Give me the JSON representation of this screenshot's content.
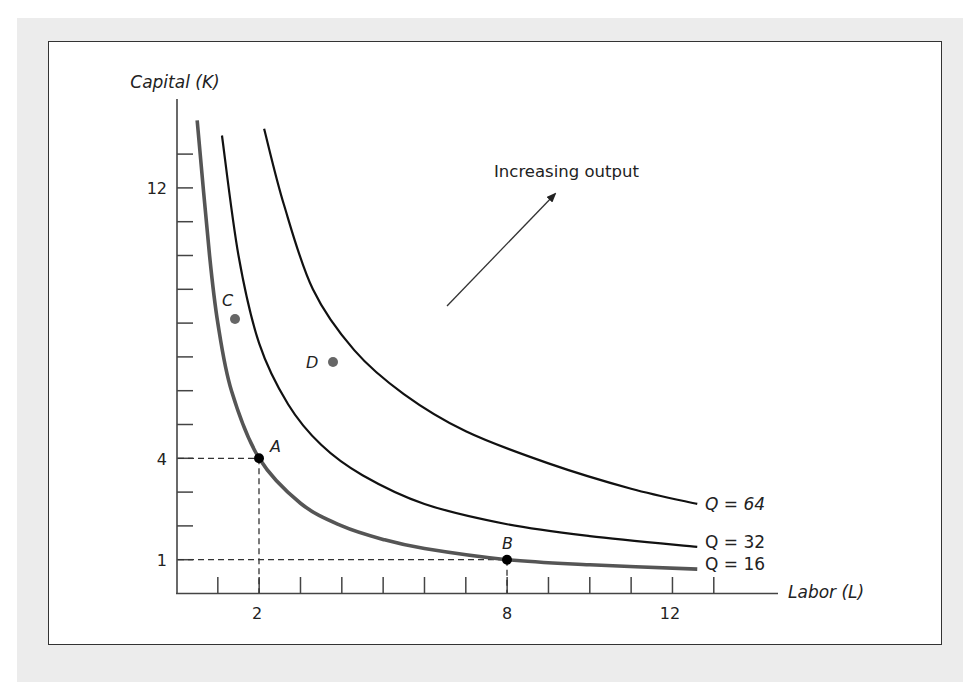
{
  "chart_data": {
    "type": "line",
    "title": "",
    "xlabel": "Labor (L)",
    "ylabel": "Capital (K)",
    "xlim": [
      0,
      14.7
    ],
    "ylim": [
      0,
      14.6
    ],
    "grid": false,
    "x_ticks": [
      1,
      2,
      3,
      4,
      5,
      6,
      7,
      8,
      9,
      10,
      11,
      12,
      13
    ],
    "x_tick_labels": [
      {
        "value": 2,
        "label": "2"
      },
      {
        "value": 8,
        "label": "8"
      },
      {
        "value": 12,
        "label": "12"
      }
    ],
    "y_ticks": [
      1,
      2,
      3,
      4,
      5,
      6,
      7,
      8,
      9,
      10,
      11,
      12,
      13
    ],
    "y_tick_labels": [
      {
        "value": 1,
        "label": "1"
      },
      {
        "value": 4,
        "label": "4"
      },
      {
        "value": 12,
        "label": "12"
      }
    ],
    "series": [
      {
        "name": "Q = 16",
        "color": "#555555",
        "width": 3.5,
        "points": [
          [
            0.5,
            14.0
          ],
          [
            0.8,
            10.0
          ],
          [
            1.0,
            8.0
          ],
          [
            1.33,
            6.0
          ],
          [
            2,
            4
          ],
          [
            3,
            2.67
          ],
          [
            4,
            2.0
          ],
          [
            5,
            1.6
          ],
          [
            6,
            1.33
          ],
          [
            8,
            1
          ],
          [
            10,
            0.85
          ],
          [
            12.6,
            0.72
          ]
        ]
      },
      {
        "name": "Q = 32",
        "color": "#111111",
        "width": 2.2,
        "points": [
          [
            1.1,
            13.55
          ],
          [
            1.5,
            10.0
          ],
          [
            2.0,
            7.4
          ],
          [
            2.7,
            5.6
          ],
          [
            3.5,
            4.4
          ],
          [
            4.5,
            3.5
          ],
          [
            6.0,
            2.65
          ],
          [
            8.0,
            2.05
          ],
          [
            10.0,
            1.7
          ],
          [
            12.6,
            1.38
          ]
        ]
      },
      {
        "name": "Q = 64",
        "color": "#111111",
        "width": 2.2,
        "points": [
          [
            2.12,
            13.75
          ],
          [
            2.6,
            11.5
          ],
          [
            3.3,
            9.0
          ],
          [
            4.3,
            7.2
          ],
          [
            5.5,
            5.9
          ],
          [
            7.0,
            4.8
          ],
          [
            9.0,
            3.85
          ],
          [
            11.0,
            3.1
          ],
          [
            12.6,
            2.65
          ]
        ]
      }
    ],
    "points": [
      {
        "label": "A",
        "L": 2,
        "K": 4,
        "color": "#000000"
      },
      {
        "label": "B",
        "L": 8,
        "K": 1,
        "color": "#000000"
      },
      {
        "label": "C",
        "L": 1.42,
        "K": 8.1,
        "color": "#666666"
      },
      {
        "label": "D",
        "L": 3.79,
        "K": 6.85,
        "color": "#666666"
      }
    ],
    "reference_lines": [
      {
        "type": "dashed",
        "from": [
          0,
          4
        ],
        "to": [
          2,
          4
        ]
      },
      {
        "type": "dashed",
        "from": [
          2,
          0
        ],
        "to": [
          2,
          4
        ]
      },
      {
        "type": "dashed",
        "from": [
          0,
          1
        ],
        "to": [
          8,
          1
        ]
      },
      {
        "type": "dashed",
        "from": [
          8,
          0
        ],
        "to": [
          8,
          1
        ]
      }
    ],
    "annotations": [
      {
        "text": "Increasing output",
        "arrow_from": [
          6.55,
          8.5
        ],
        "arrow_to": [
          9.2,
          11.8
        ]
      }
    ]
  },
  "labels": {
    "y_axis": "Capital (K)",
    "x_axis": "Labor (L)",
    "annotation": "Increasing output",
    "tick_12_y": "12",
    "tick_4_y": "4",
    "tick_1_y": "1",
    "tick_2_x": "2",
    "tick_8_x": "8",
    "tick_12_x": "12",
    "q64": "Q = 64",
    "q32": "Q = 32",
    "q16": "Q = 16",
    "point_a": "A",
    "point_b": "B",
    "point_c": "C",
    "point_d": "D"
  }
}
